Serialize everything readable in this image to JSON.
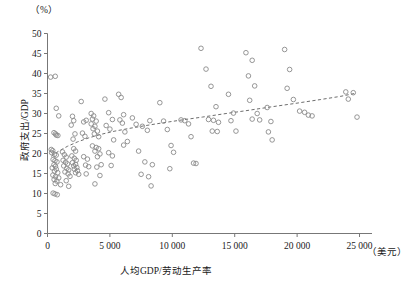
{
  "chart_data": {
    "type": "scatter",
    "title": "",
    "xlabel": "人均GDP/劳动生产率",
    "ylabel": "政府支出/GDP",
    "x_unit_label": "（美元）",
    "y_unit_label": "（%）",
    "xlim": [
      0,
      26000
    ],
    "ylim": [
      0,
      50
    ],
    "x_ticks": [
      0,
      5000,
      10000,
      15000,
      20000,
      25000
    ],
    "x_tick_labels": [
      "0",
      "5 000",
      "10 000",
      "15 000",
      "20 000",
      "25 000"
    ],
    "y_ticks": [
      0,
      5,
      10,
      15,
      20,
      25,
      30,
      35,
      40,
      45,
      50
    ],
    "y_tick_labels": [
      "0",
      "5",
      "10",
      "15",
      "20",
      "25",
      "30",
      "35",
      "40",
      "45",
      "50"
    ],
    "grid": false,
    "legend": false,
    "marker": {
      "shape": "circle-open",
      "color": "#8a8a8a",
      "size": 4.6,
      "stroke_width": 0.9
    },
    "trendline": {
      "style": "dashed",
      "color": "#6e6e6e",
      "width": 1.0,
      "points": [
        [
          300,
          19.3
        ],
        [
          900,
          20.6
        ],
        [
          1600,
          21.8
        ],
        [
          2400,
          22.9
        ],
        [
          3300,
          23.9
        ],
        [
          4300,
          24.8
        ],
        [
          5400,
          25.6
        ],
        [
          6600,
          26.3
        ],
        [
          7900,
          27.0
        ],
        [
          9300,
          27.7
        ],
        [
          10800,
          28.4
        ],
        [
          12400,
          29.1
        ],
        [
          14100,
          29.9
        ],
        [
          15900,
          30.7
        ],
        [
          17800,
          31.6
        ],
        [
          19800,
          32.5
        ],
        [
          21900,
          33.5
        ],
        [
          23500,
          34.3
        ],
        [
          24600,
          35.0
        ]
      ]
    },
    "points": [
      [
        250,
        39.1
      ],
      [
        620,
        39.3
      ],
      [
        700,
        31.3
      ],
      [
        900,
        29.4
      ],
      [
        520,
        25.2
      ],
      [
        640,
        24.9
      ],
      [
        700,
        24.6
      ],
      [
        830,
        24.5
      ],
      [
        300,
        21.0
      ],
      [
        420,
        20.7
      ],
      [
        330,
        20.2
      ],
      [
        560,
        19.8
      ],
      [
        700,
        19.6
      ],
      [
        450,
        18.5
      ],
      [
        600,
        18.2
      ],
      [
        760,
        17.9
      ],
      [
        520,
        17.2
      ],
      [
        640,
        16.8
      ],
      [
        380,
        16.4
      ],
      [
        700,
        16.1
      ],
      [
        560,
        15.6
      ],
      [
        820,
        15.2
      ],
      [
        430,
        14.6
      ],
      [
        640,
        14.2
      ],
      [
        900,
        13.9
      ],
      [
        530,
        13.5
      ],
      [
        750,
        13.1
      ],
      [
        620,
        12.5
      ],
      [
        1050,
        12.2
      ],
      [
        450,
        10.1
      ],
      [
        600,
        9.9
      ],
      [
        780,
        9.7
      ],
      [
        1200,
        20.4
      ],
      [
        1350,
        19.7
      ],
      [
        1500,
        19.1
      ],
      [
        1250,
        18.3
      ],
      [
        1450,
        17.8
      ],
      [
        1600,
        17.4
      ],
      [
        1300,
        16.9
      ],
      [
        1550,
        16.3
      ],
      [
        1700,
        15.9
      ],
      [
        1400,
        15.4
      ],
      [
        1650,
        14.9
      ],
      [
        1800,
        14.3
      ],
      [
        1500,
        13.2
      ],
      [
        1700,
        11.8
      ],
      [
        2000,
        29.3
      ],
      [
        2100,
        28.2
      ],
      [
        1900,
        27.1
      ],
      [
        2200,
        24.9
      ],
      [
        2050,
        23.6
      ],
      [
        2100,
        21.2
      ],
      [
        2250,
        20.6
      ],
      [
        1950,
        19.4
      ],
      [
        2150,
        18.8
      ],
      [
        2300,
        18.3
      ],
      [
        2000,
        17.7
      ],
      [
        2250,
        17.3
      ],
      [
        2100,
        16.9
      ],
      [
        2350,
        16.5
      ],
      [
        2150,
        16.1
      ],
      [
        2400,
        15.7
      ],
      [
        2250,
        15.2
      ],
      [
        2500,
        14.8
      ],
      [
        2700,
        33.0
      ],
      [
        2900,
        27.9
      ],
      [
        3100,
        28.3
      ],
      [
        2800,
        25.1
      ],
      [
        3000,
        24.3
      ],
      [
        2900,
        19.2
      ],
      [
        3200,
        18.6
      ],
      [
        3050,
        17.1
      ],
      [
        3300,
        16.7
      ],
      [
        3100,
        14.9
      ],
      [
        3500,
        30.0
      ],
      [
        3700,
        29.4
      ],
      [
        3600,
        28.6
      ],
      [
        3900,
        28.1
      ],
      [
        3500,
        27.4
      ],
      [
        3800,
        26.8
      ],
      [
        3650,
        26.2
      ],
      [
        4000,
        25.6
      ],
      [
        3750,
        24.9
      ],
      [
        4100,
        24.2
      ],
      [
        3600,
        21.9
      ],
      [
        3900,
        21.5
      ],
      [
        4100,
        21.2
      ],
      [
        3800,
        20.6
      ],
      [
        4200,
        19.9
      ],
      [
        4000,
        19.2
      ],
      [
        4300,
        17.2
      ],
      [
        3950,
        16.6
      ],
      [
        4200,
        14.5
      ],
      [
        3800,
        12.4
      ],
      [
        4600,
        33.6
      ],
      [
        4900,
        30.2
      ],
      [
        5200,
        28.5
      ],
      [
        4700,
        27.0
      ],
      [
        5000,
        26.1
      ],
      [
        5300,
        23.4
      ],
      [
        4900,
        20.2
      ],
      [
        5200,
        19.4
      ],
      [
        5100,
        17.0
      ],
      [
        5700,
        34.8
      ],
      [
        5900,
        34.0
      ],
      [
        6100,
        29.7
      ],
      [
        5800,
        28.4
      ],
      [
        6000,
        27.6
      ],
      [
        6200,
        25.4
      ],
      [
        6400,
        23.0
      ],
      [
        6100,
        22.1
      ],
      [
        6800,
        28.9
      ],
      [
        7100,
        27.3
      ],
      [
        7300,
        20.6
      ],
      [
        7600,
        26.8
      ],
      [
        7800,
        17.9
      ],
      [
        7500,
        14.8
      ],
      [
        8200,
        28.2
      ],
      [
        8000,
        25.8
      ],
      [
        8400,
        17.2
      ],
      [
        8100,
        14.2
      ],
      [
        8300,
        11.9
      ],
      [
        9000,
        32.7
      ],
      [
        9300,
        28.1
      ],
      [
        9600,
        26.0
      ],
      [
        9900,
        22.0
      ],
      [
        10100,
        20.3
      ],
      [
        9800,
        16.2
      ],
      [
        10700,
        28.4
      ],
      [
        11000,
        28.2
      ],
      [
        11300,
        27.4
      ],
      [
        11500,
        24.2
      ],
      [
        11700,
        17.6
      ],
      [
        11900,
        17.5
      ],
      [
        12300,
        46.3
      ],
      [
        12700,
        41.1
      ],
      [
        13100,
        36.8
      ],
      [
        13500,
        31.7
      ],
      [
        12900,
        28.5
      ],
      [
        13300,
        28.3
      ],
      [
        13700,
        27.8
      ],
      [
        13200,
        25.6
      ],
      [
        13600,
        25.5
      ],
      [
        14500,
        34.8
      ],
      [
        14900,
        30.1
      ],
      [
        14700,
        28.2
      ],
      [
        15100,
        25.6
      ],
      [
        15900,
        45.2
      ],
      [
        16400,
        43.3
      ],
      [
        16100,
        39.4
      ],
      [
        16600,
        36.9
      ],
      [
        16200,
        33.3
      ],
      [
        16800,
        30.0
      ],
      [
        16400,
        28.6
      ],
      [
        17000,
        28.4
      ],
      [
        17600,
        31.5
      ],
      [
        17900,
        28.0
      ],
      [
        17700,
        25.4
      ],
      [
        18000,
        23.4
      ],
      [
        19000,
        46.0
      ],
      [
        19400,
        41.0
      ],
      [
        19200,
        36.3
      ],
      [
        19700,
        33.5
      ],
      [
        20200,
        30.6
      ],
      [
        20600,
        30.3
      ],
      [
        20900,
        29.6
      ],
      [
        21200,
        29.4
      ],
      [
        23900,
        35.4
      ],
      [
        24500,
        35.2
      ],
      [
        24100,
        33.6
      ],
      [
        24800,
        29.1
      ]
    ]
  }
}
